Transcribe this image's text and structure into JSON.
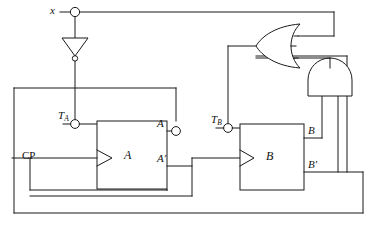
{
  "diagram": {
    "type": "logic-circuit",
    "stroke_color": "#1a1a1a",
    "background_color": "#ffffff"
  },
  "labels": {
    "input_x": "x",
    "clock": "CP",
    "t_a_name": "T",
    "t_a_sub": "A",
    "t_b_name": "T",
    "t_b_sub": "B",
    "ff_a": "A",
    "ff_b": "B",
    "out_a": "A",
    "out_a_not": "A′",
    "out_b": "B",
    "out_b_not": "B′"
  },
  "components": [
    {
      "name": "input-terminal-x",
      "kind": "terminal",
      "label": "x"
    },
    {
      "name": "inverter-x",
      "kind": "not-gate",
      "label": ""
    },
    {
      "name": "flipflop-a",
      "kind": "t-flip-flop",
      "label": "A"
    },
    {
      "name": "flipflop-b",
      "kind": "t-flip-flop",
      "label": "B"
    },
    {
      "name": "or-gate",
      "kind": "or-gate",
      "label": ""
    },
    {
      "name": "and-gate",
      "kind": "and-gate",
      "label": ""
    },
    {
      "name": "terminal-ta",
      "kind": "terminal",
      "label": "T_A"
    },
    {
      "name": "terminal-tb",
      "kind": "terminal",
      "label": "T_B"
    },
    {
      "name": "terminal-a-out",
      "kind": "terminal",
      "label": "A"
    }
  ],
  "connections": [
    {
      "from": "input-terminal-x",
      "to": "inverter-x"
    },
    {
      "from": "input-terminal-x",
      "to": "or-gate"
    },
    {
      "from": "inverter-x",
      "to": "terminal-ta"
    },
    {
      "from": "terminal-ta",
      "to": "flipflop-a"
    },
    {
      "from": "clock-cp",
      "to": "flipflop-a"
    },
    {
      "from": "clock-cp",
      "to": "flipflop-b"
    },
    {
      "from": "flipflop-a",
      "to": "terminal-a-out"
    },
    {
      "from": "or-gate",
      "to": "terminal-tb"
    },
    {
      "from": "terminal-tb",
      "to": "flipflop-b"
    },
    {
      "from": "flipflop-b",
      "to": "and-gate"
    },
    {
      "from": "and-gate",
      "to": "or-gate"
    },
    {
      "from": "flipflop-b",
      "to": "or-gate"
    }
  ]
}
